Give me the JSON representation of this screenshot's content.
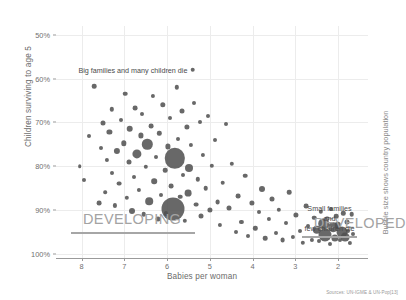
{
  "chart_data": {
    "type": "scatter",
    "title": "",
    "xlabel": "Babies per woman",
    "ylabel": "Children surviving to age 5",
    "xticks": [
      "8",
      "7",
      "6",
      "5",
      "4",
      "3",
      "2"
    ],
    "xtick_values": [
      8,
      7,
      6,
      5,
      4,
      3,
      2
    ],
    "yticks": [
      "100%",
      "90%",
      "80%",
      "70%",
      "60%",
      "50%"
    ],
    "ytick_values": [
      100,
      90,
      80,
      70,
      60,
      50
    ],
    "xlim": [
      8.6,
      1.3
    ],
    "ylim": [
      48,
      101
    ],
    "x_axis_reversed": true,
    "grid": true,
    "legend": "none",
    "size_note": "Bubble size shows country population",
    "source": "Sources: UN-IGME & UN-Pop[13]",
    "bubble_color": "#4f4f4f",
    "frame_color": "#a6a6a6",
    "annotations": [
      {
        "name": "developing",
        "title": "DEVELOPING",
        "caption": "Big families and many children die",
        "box_x": [
          8.25,
          5.35
        ],
        "box_y": [
          95.0,
          56.5
        ]
      },
      {
        "name": "developed",
        "title": "DEVELOPED",
        "caption": "Small families and\nfew children die",
        "box_x": [
          2.85,
          1.55
        ],
        "box_y": [
          96.0,
          88.0
        ]
      }
    ],
    "points": [
      {
        "x": 8.05,
        "y": 80.0,
        "r": 1.8
      },
      {
        "x": 7.95,
        "y": 83.2,
        "r": 2.0
      },
      {
        "x": 7.82,
        "y": 73.2,
        "r": 2.0
      },
      {
        "x": 7.7,
        "y": 61.8,
        "r": 2.3
      },
      {
        "x": 7.6,
        "y": 88.5,
        "r": 2.4
      },
      {
        "x": 7.55,
        "y": 75.8,
        "r": 2.0
      },
      {
        "x": 7.5,
        "y": 70.2,
        "r": 2.5
      },
      {
        "x": 7.45,
        "y": 86.0,
        "r": 1.8
      },
      {
        "x": 7.4,
        "y": 78.5,
        "r": 2.1
      },
      {
        "x": 7.35,
        "y": 72.2,
        "r": 2.6
      },
      {
        "x": 7.3,
        "y": 67.0,
        "r": 2.2
      },
      {
        "x": 7.28,
        "y": 81.5,
        "r": 2.0
      },
      {
        "x": 7.22,
        "y": 89.0,
        "r": 2.1
      },
      {
        "x": 7.18,
        "y": 76.5,
        "r": 3.1
      },
      {
        "x": 7.12,
        "y": 84.0,
        "r": 2.4
      },
      {
        "x": 7.08,
        "y": 69.5,
        "r": 2.0
      },
      {
        "x": 7.02,
        "y": 74.8,
        "r": 2.7
      },
      {
        "x": 6.98,
        "y": 63.5,
        "r": 2.3
      },
      {
        "x": 6.95,
        "y": 87.2,
        "r": 2.2
      },
      {
        "x": 6.9,
        "y": 79.0,
        "r": 2.5
      },
      {
        "x": 6.88,
        "y": 71.5,
        "r": 3.3
      },
      {
        "x": 6.82,
        "y": 90.2,
        "r": 3.0
      },
      {
        "x": 6.78,
        "y": 82.5,
        "r": 2.0
      },
      {
        "x": 6.75,
        "y": 66.8,
        "r": 2.4
      },
      {
        "x": 6.7,
        "y": 77.2,
        "r": 4.6
      },
      {
        "x": 6.66,
        "y": 85.5,
        "r": 2.1
      },
      {
        "x": 6.62,
        "y": 73.0,
        "r": 2.6
      },
      {
        "x": 6.58,
        "y": 68.2,
        "r": 2.0
      },
      {
        "x": 6.55,
        "y": 91.0,
        "r": 2.3
      },
      {
        "x": 6.5,
        "y": 80.2,
        "r": 2.2
      },
      {
        "x": 6.46,
        "y": 75.0,
        "r": 5.2
      },
      {
        "x": 6.42,
        "y": 88.0,
        "r": 3.8
      },
      {
        "x": 6.38,
        "y": 70.8,
        "r": 2.4
      },
      {
        "x": 6.34,
        "y": 64.0,
        "r": 2.1
      },
      {
        "x": 6.3,
        "y": 83.5,
        "r": 2.8
      },
      {
        "x": 6.26,
        "y": 78.0,
        "r": 2.0
      },
      {
        "x": 6.22,
        "y": 92.0,
        "r": 2.5
      },
      {
        "x": 6.18,
        "y": 72.5,
        "r": 2.2
      },
      {
        "x": 6.14,
        "y": 86.5,
        "r": 2.0
      },
      {
        "x": 6.1,
        "y": 66.0,
        "r": 2.7
      },
      {
        "x": 6.05,
        "y": 81.0,
        "r": 2.3
      },
      {
        "x": 6.02,
        "y": 90.8,
        "r": 2.1
      },
      {
        "x": 5.98,
        "y": 75.5,
        "r": 2.6
      },
      {
        "x": 5.94,
        "y": 69.0,
        "r": 2.0
      },
      {
        "x": 5.9,
        "y": 84.5,
        "r": 2.4
      },
      {
        "x": 5.86,
        "y": 89.8,
        "r": 11.5
      },
      {
        "x": 5.82,
        "y": 78.2,
        "r": 10.2
      },
      {
        "x": 5.78,
        "y": 62.0,
        "r": 2.2
      },
      {
        "x": 5.74,
        "y": 73.8,
        "r": 2.0
      },
      {
        "x": 5.7,
        "y": 87.0,
        "r": 2.3
      },
      {
        "x": 5.66,
        "y": 67.5,
        "r": 2.5
      },
      {
        "x": 5.62,
        "y": 82.0,
        "r": 2.0
      },
      {
        "x": 5.58,
        "y": 92.5,
        "r": 2.2
      },
      {
        "x": 5.54,
        "y": 71.0,
        "r": 2.6
      },
      {
        "x": 5.5,
        "y": 86.2,
        "r": 3.4
      },
      {
        "x": 5.48,
        "y": 80.5,
        "r": 4.0
      },
      {
        "x": 5.44,
        "y": 75.2,
        "r": 2.1
      },
      {
        "x": 5.4,
        "y": 58.0,
        "r": 2.3
      },
      {
        "x": 5.36,
        "y": 65.5,
        "r": 2.0
      },
      {
        "x": 5.32,
        "y": 88.8,
        "r": 2.4
      },
      {
        "x": 5.28,
        "y": 83.0,
        "r": 2.2
      },
      {
        "x": 5.24,
        "y": 70.0,
        "r": 2.0
      },
      {
        "x": 5.2,
        "y": 91.5,
        "r": 2.5
      },
      {
        "x": 5.16,
        "y": 77.5,
        "r": 2.1
      },
      {
        "x": 5.1,
        "y": 85.0,
        "r": 2.3
      },
      {
        "x": 5.05,
        "y": 68.5,
        "r": 2.0
      },
      {
        "x": 5.0,
        "y": 90.0,
        "r": 2.6
      },
      {
        "x": 4.95,
        "y": 80.0,
        "r": 2.2
      },
      {
        "x": 4.88,
        "y": 74.0,
        "r": 2.0
      },
      {
        "x": 4.82,
        "y": 88.2,
        "r": 2.4
      },
      {
        "x": 4.76,
        "y": 93.5,
        "r": 2.1
      },
      {
        "x": 4.7,
        "y": 83.8,
        "r": 2.3
      },
      {
        "x": 4.62,
        "y": 70.5,
        "r": 2.0
      },
      {
        "x": 4.56,
        "y": 89.5,
        "r": 2.5
      },
      {
        "x": 4.48,
        "y": 79.5,
        "r": 2.2
      },
      {
        "x": 4.4,
        "y": 95.0,
        "r": 2.0
      },
      {
        "x": 4.34,
        "y": 86.8,
        "r": 2.4
      },
      {
        "x": 4.26,
        "y": 92.8,
        "r": 2.1
      },
      {
        "x": 4.18,
        "y": 82.2,
        "r": 2.3
      },
      {
        "x": 4.1,
        "y": 96.0,
        "r": 2.0
      },
      {
        "x": 4.02,
        "y": 88.5,
        "r": 2.6
      },
      {
        "x": 3.94,
        "y": 94.2,
        "r": 2.2
      },
      {
        "x": 3.86,
        "y": 90.5,
        "r": 2.0
      },
      {
        "x": 3.78,
        "y": 85.2,
        "r": 3.0
      },
      {
        "x": 3.7,
        "y": 96.5,
        "r": 2.3
      },
      {
        "x": 3.62,
        "y": 92.0,
        "r": 2.1
      },
      {
        "x": 3.54,
        "y": 87.5,
        "r": 2.5
      },
      {
        "x": 3.46,
        "y": 95.2,
        "r": 2.0
      },
      {
        "x": 3.38,
        "y": 90.0,
        "r": 2.2
      },
      {
        "x": 3.3,
        "y": 97.0,
        "r": 2.4
      },
      {
        "x": 3.22,
        "y": 93.0,
        "r": 2.0
      },
      {
        "x": 3.14,
        "y": 86.0,
        "r": 2.3
      },
      {
        "x": 3.06,
        "y": 96.2,
        "r": 2.1
      },
      {
        "x": 2.98,
        "y": 91.2,
        "r": 2.6
      },
      {
        "x": 2.9,
        "y": 94.8,
        "r": 2.0
      },
      {
        "x": 2.82,
        "y": 97.5,
        "r": 2.2
      },
      {
        "x": 2.74,
        "y": 89.2,
        "r": 2.4
      },
      {
        "x": 2.7,
        "y": 93.8,
        "r": 2.0
      },
      {
        "x": 2.62,
        "y": 96.8,
        "r": 2.1
      },
      {
        "x": 2.56,
        "y": 91.8,
        "r": 2.3
      },
      {
        "x": 2.5,
        "y": 94.5,
        "r": 4.2
      },
      {
        "x": 2.44,
        "y": 97.2,
        "r": 2.0
      },
      {
        "x": 2.4,
        "y": 90.5,
        "r": 2.2
      },
      {
        "x": 2.34,
        "y": 93.2,
        "r": 5.8
      },
      {
        "x": 2.3,
        "y": 95.8,
        "r": 6.5
      },
      {
        "x": 2.26,
        "y": 92.0,
        "r": 2.4
      },
      {
        "x": 2.2,
        "y": 97.8,
        "r": 2.0
      },
      {
        "x": 2.16,
        "y": 89.8,
        "r": 2.1
      },
      {
        "x": 2.12,
        "y": 94.0,
        "r": 4.8
      },
      {
        "x": 2.08,
        "y": 96.5,
        "r": 3.6
      },
      {
        "x": 2.04,
        "y": 91.5,
        "r": 2.3
      },
      {
        "x": 2.0,
        "y": 93.5,
        "r": 3.2
      },
      {
        "x": 1.96,
        "y": 97.0,
        "r": 2.0
      },
      {
        "x": 1.92,
        "y": 95.0,
        "r": 5.5
      },
      {
        "x": 1.88,
        "y": 90.8,
        "r": 2.2
      },
      {
        "x": 1.84,
        "y": 96.2,
        "r": 4.4
      },
      {
        "x": 1.8,
        "y": 92.8,
        "r": 2.5
      },
      {
        "x": 1.76,
        "y": 94.8,
        "r": 2.0
      },
      {
        "x": 1.72,
        "y": 97.5,
        "r": 2.1
      },
      {
        "x": 1.68,
        "y": 91.0,
        "r": 2.3
      },
      {
        "x": 1.64,
        "y": 95.5,
        "r": 2.0
      }
    ]
  }
}
